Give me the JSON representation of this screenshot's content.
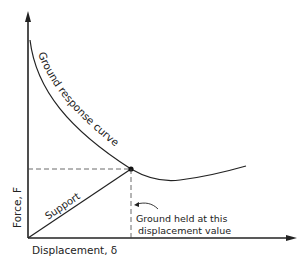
{
  "diagram": {
    "type": "ground-support interaction diagram",
    "axes": {
      "x_label": "Displacement, δ",
      "y_label": "Force, F"
    },
    "curves": [
      {
        "name": "ground-response-curve",
        "label": "Ground response curve"
      },
      {
        "name": "support-line",
        "label": "Support"
      }
    ],
    "annotation": {
      "line1": "Ground held at this",
      "line2": "displacement value"
    },
    "colors": {
      "ink": "#222222",
      "background": "#ffffff"
    }
  }
}
